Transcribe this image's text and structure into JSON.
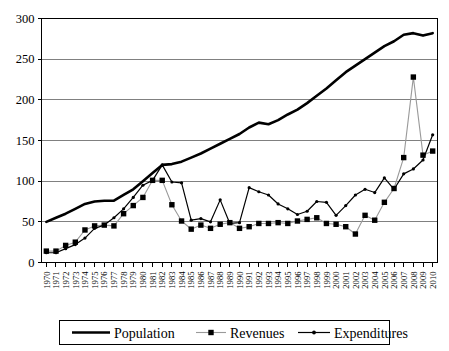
{
  "chart_data": {
    "type": "line",
    "title": "",
    "xlabel": "",
    "ylabel": "",
    "ylim": [
      0,
      300
    ],
    "ytick_values": [
      0,
      50,
      100,
      150,
      200,
      250,
      300
    ],
    "ytick_labels": [
      "0",
      "50",
      "100",
      "150",
      "200",
      "250",
      "300"
    ],
    "grid": true,
    "legend_position": "bottom",
    "categories": [
      "1970",
      "1971",
      "1972",
      "1973",
      "1974",
      "1975",
      "1976",
      "1977",
      "1978",
      "1979",
      "1980",
      "1981",
      "1982",
      "1983",
      "1984",
      "1985",
      "1986",
      "1987",
      "1988",
      "1989",
      "1990",
      "1991",
      "1992",
      "1993",
      "1994",
      "1995",
      "1996",
      "1997",
      "1998",
      "1999",
      "2000",
      "2001",
      "2002",
      "2003",
      "2004",
      "2005",
      "2006",
      "2007",
      "2008",
      "2009",
      "2010"
    ],
    "series": [
      {
        "name": "Population",
        "marker": "none",
        "color": "#000000",
        "values": [
          50,
          55,
          60,
          66,
          72,
          75,
          76,
          76,
          83,
          90,
          100,
          110,
          120,
          121,
          124,
          129,
          134,
          140,
          146,
          152,
          158,
          166,
          172,
          170,
          175,
          182,
          188,
          196,
          205,
          214,
          224,
          234,
          242,
          250,
          258,
          266,
          272,
          280,
          282,
          279,
          282
        ]
      },
      {
        "name": "Revenues",
        "marker": "square",
        "color": "#9a9a9a",
        "values": [
          14,
          14,
          21,
          25,
          40,
          45,
          46,
          45,
          60,
          70,
          80,
          101,
          101,
          71,
          51,
          41,
          46,
          42,
          47,
          49,
          42,
          44,
          48,
          48,
          49,
          48,
          51,
          53,
          55,
          48,
          47,
          44,
          35,
          58,
          52,
          74,
          91,
          129,
          228,
          132,
          137
        ]
      },
      {
        "name": "Expenditures",
        "marker": "dot",
        "color": "#000000",
        "values": [
          12,
          12,
          17,
          22,
          30,
          42,
          46,
          55,
          66,
          80,
          95,
          101,
          120,
          99,
          98,
          52,
          54,
          50,
          77,
          48,
          49,
          92,
          87,
          83,
          72,
          66,
          59,
          63,
          75,
          74,
          58,
          70,
          83,
          90,
          86,
          104,
          90,
          109,
          115,
          126,
          157
        ]
      }
    ]
  },
  "legend": {
    "items": [
      {
        "label": "Population",
        "key": "legend-item-population"
      },
      {
        "label": "Revenues",
        "key": "legend-item-revenues"
      },
      {
        "label": "Expenditures",
        "key": "legend-item-expenditures"
      }
    ]
  }
}
